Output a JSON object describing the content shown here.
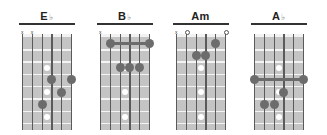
{
  "chords": [
    {
      "name": "E",
      "accidental": "♭",
      "markers": [
        {
          "string": 1,
          "type": "x"
        },
        {
          "string": 2,
          "type": "x"
        }
      ],
      "fingers": [
        {
          "string": 4,
          "fret": 4
        },
        {
          "string": 6,
          "fret": 4
        },
        {
          "string": 5,
          "fret": 5
        },
        {
          "string": 3,
          "fret": 6
        }
      ],
      "barre": null
    },
    {
      "name": "B",
      "accidental": "♭",
      "markers": [
        {
          "string": 1,
          "type": "x"
        }
      ],
      "fingers": [
        {
          "string": 3,
          "fret": 3
        },
        {
          "string": 4,
          "fret": 3
        },
        {
          "string": 5,
          "fret": 3
        }
      ],
      "barre": {
        "fret": 1,
        "from_string": 2,
        "to_string": 6
      }
    },
    {
      "name": "Am",
      "accidental": "",
      "markers": [
        {
          "string": 1,
          "type": "x"
        },
        {
          "string": 2,
          "type": "o"
        },
        {
          "string": 6,
          "type": "o"
        }
      ],
      "fingers": [
        {
          "string": 5,
          "fret": 1
        },
        {
          "string": 3,
          "fret": 2
        },
        {
          "string": 4,
          "fret": 2
        }
      ],
      "barre": null
    },
    {
      "name": "A",
      "accidental": "♭",
      "markers": [],
      "fingers": [
        {
          "string": 4,
          "fret": 5
        },
        {
          "string": 2,
          "fret": 6
        },
        {
          "string": 3,
          "fret": 6
        }
      ],
      "barre": {
        "fret": 4,
        "from_string": 1,
        "to_string": 6
      }
    }
  ],
  "inlay_frets": [
    3,
    5,
    7
  ],
  "colors": {
    "board": "#c4c4c4",
    "finger": "#6c6c6c",
    "fret_line": "#f4f4f4",
    "string": "#5a5a5a",
    "title": "#222222"
  }
}
